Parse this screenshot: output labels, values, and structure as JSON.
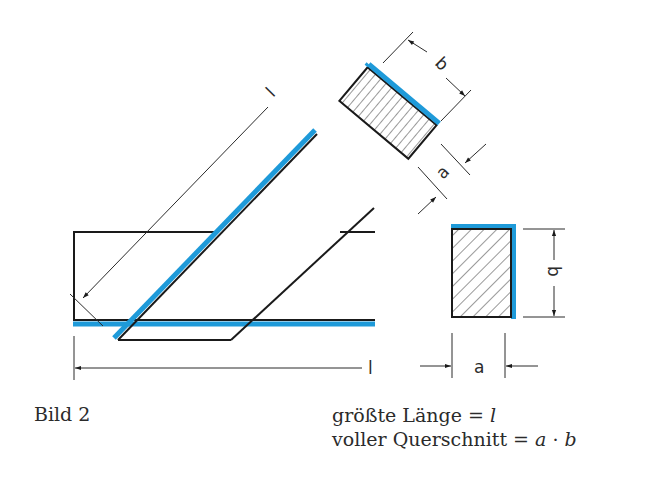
{
  "figure": {
    "label": "Bild 2",
    "colors": {
      "line": "#1a1a1a",
      "highlight_edge": "#1e9ad9",
      "dimension": "#2b2b2b",
      "background": "#ffffff"
    },
    "dimensions": {
      "diagonal_length_label": "l",
      "horizontal_length_label": "l",
      "rotated_section_width_label": "b",
      "rotated_section_thickness_label": "a",
      "section_height_label": "b",
      "section_width_label": "a"
    }
  },
  "formulas": {
    "line1_text": "größte Länge = ",
    "line1_var": "l",
    "line2_text": "voller Querschnitt = ",
    "line2_var_a": "a",
    "line2_dot": " · ",
    "line2_var_b": "b"
  }
}
